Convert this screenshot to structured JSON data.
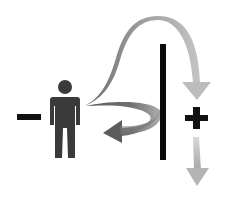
{
  "diagram": {
    "title": "Person, barrier, and deflected/overcoming arrows",
    "symbols": {
      "minus": "−",
      "plus": "+"
    },
    "elements": [
      {
        "id": "minus-sign",
        "label": "Negative side"
      },
      {
        "id": "person-figure",
        "label": "Person"
      },
      {
        "id": "barrier-bar",
        "label": "Barrier"
      },
      {
        "id": "arc-over-arrow",
        "label": "Arrow arcing over barrier"
      },
      {
        "id": "deflected-arrow",
        "label": "Arrow deflected back from barrier"
      },
      {
        "id": "plus-sign",
        "label": "Positive side"
      },
      {
        "id": "down-arrow",
        "label": "Downward arrow"
      }
    ],
    "colors": {
      "background": "#ffffff",
      "figure": "#3a3a3a",
      "bar": "#0a0a0a",
      "sign": "#111111",
      "arrow_dark": "#5a5a5a",
      "arrow_light": "#c8c8c8"
    }
  }
}
